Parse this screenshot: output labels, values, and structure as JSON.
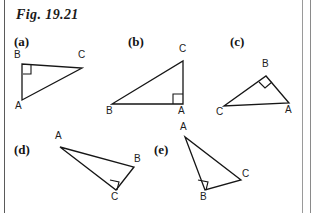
{
  "figure": {
    "title": "Fig. 19.21",
    "ink_color": "#161616",
    "background_color": "#ffffff"
  },
  "panels": [
    {
      "id": "a",
      "label": "(a)",
      "label_pos": {
        "x": 14,
        "y": 34
      },
      "right_angle_at": "B",
      "vertices": [
        {
          "name": "A",
          "x": 22,
          "y": 100,
          "label_x": 15,
          "label_y": 101
        },
        {
          "name": "B",
          "x": 22,
          "y": 64,
          "label_x": 14,
          "label_y": 50
        },
        {
          "name": "C",
          "x": 82,
          "y": 68,
          "label_x": 78,
          "label_y": 50
        }
      ],
      "right_angle_mark": "23,74 31,74 31,65"
    },
    {
      "id": "b",
      "label": "(b)",
      "label_pos": {
        "x": 128,
        "y": 34
      },
      "right_angle_at": "A",
      "vertices": [
        {
          "name": "A",
          "x": 183,
          "y": 104,
          "label_x": 178,
          "label_y": 106
        },
        {
          "name": "B",
          "x": 112,
          "y": 104,
          "label_x": 106,
          "label_y": 106
        },
        {
          "name": "C",
          "x": 183,
          "y": 61,
          "label_x": 179,
          "label_y": 44
        }
      ],
      "right_angle_mark": "173,104 173,94 183,94"
    },
    {
      "id": "c",
      "label": "(c)",
      "label_pos": {
        "x": 230,
        "y": 34
      },
      "right_angle_at": "B",
      "vertices": [
        {
          "name": "A",
          "x": 289,
          "y": 103,
          "label_x": 285,
          "label_y": 105
        },
        {
          "name": "B",
          "x": 266,
          "y": 76,
          "label_x": 262,
          "label_y": 59
        },
        {
          "name": "C",
          "x": 224,
          "y": 106,
          "label_x": 216,
          "label_y": 107
        }
      ],
      "right_angle_mark": "259,82 265,88 272,82"
    },
    {
      "id": "d",
      "label": "(d)",
      "label_pos": {
        "x": 14,
        "y": 142
      },
      "right_angle_at": "C",
      "vertices": [
        {
          "name": "A",
          "x": 60,
          "y": 147,
          "label_x": 55,
          "label_y": 131
        },
        {
          "name": "B",
          "x": 134,
          "y": 167,
          "label_x": 134,
          "label_y": 154
        },
        {
          "name": "C",
          "x": 116,
          "y": 190,
          "label_x": 111,
          "label_y": 192
        }
      ],
      "right_angle_mark": "110,180 119,182 117,190"
    },
    {
      "id": "e",
      "label": "(e)",
      "label_pos": {
        "x": 154,
        "y": 142
      },
      "right_angle_at": "B",
      "vertices": [
        {
          "name": "A",
          "x": 185,
          "y": 137,
          "label_x": 180,
          "label_y": 122
        },
        {
          "name": "B",
          "x": 205,
          "y": 190,
          "label_x": 200,
          "label_y": 192
        },
        {
          "name": "C",
          "x": 241,
          "y": 180,
          "label_x": 242,
          "label_y": 169
        }
      ],
      "right_angle_mark": "198,180 208,182 206,190"
    }
  ]
}
